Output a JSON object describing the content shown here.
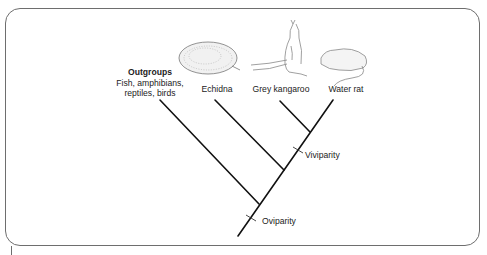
{
  "diagram": {
    "type": "cladogram",
    "taxa": [
      {
        "id": "outgroups",
        "title": "Outgroups",
        "subtitle_lines": [
          "Fish, amphibians,",
          "reptiles, birds"
        ]
      },
      {
        "id": "echidna",
        "label": "Echidna",
        "illustration": "echidna-icon"
      },
      {
        "id": "grey-kangaroo",
        "label": "Grey kangaroo",
        "illustration": "kangaroo-icon"
      },
      {
        "id": "water-rat",
        "label": "Water rat",
        "illustration": "water-rat-icon"
      }
    ],
    "traits": [
      {
        "id": "oviparity",
        "label": "Oviparity"
      },
      {
        "id": "viviparity",
        "label": "Viviparity"
      }
    ],
    "colors": {
      "line": "#111111",
      "frame": "#6e6e6e",
      "text": "#222222"
    }
  }
}
